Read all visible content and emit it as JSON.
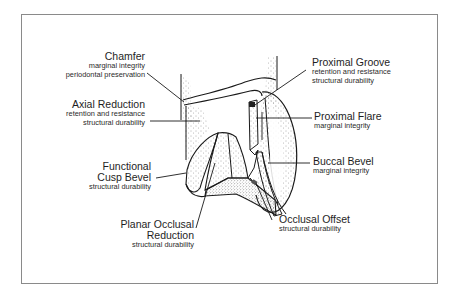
{
  "diagram": {
    "type": "labeled-illustration",
    "labels": [
      {
        "id": "chamfer",
        "title": "Chamfer",
        "subtitles": [
          "marginal integrity",
          "periodontal preservation"
        ]
      },
      {
        "id": "axial-reduction",
        "title": "Axial Reduction",
        "subtitles": [
          "retention and resistance",
          "structural durability"
        ]
      },
      {
        "id": "functional-cusp-bevel",
        "title_lines": [
          "Functional",
          "Cusp Bevel"
        ],
        "subtitles": [
          "structural durability"
        ]
      },
      {
        "id": "planar-occlusal-reduction",
        "title_lines": [
          "Planar Occlusal",
          "Reduction"
        ],
        "subtitles": [
          "structural durability"
        ]
      },
      {
        "id": "proximal-groove",
        "title": "Proximal Groove",
        "subtitles": [
          "retention and resistance",
          "structural durability"
        ]
      },
      {
        "id": "proximal-flare",
        "title": "Proximal Flare",
        "subtitles": [
          "marginal integrity"
        ]
      },
      {
        "id": "buccal-bevel",
        "title": "Buccal Bevel",
        "subtitles": [
          "marginal integrity"
        ]
      },
      {
        "id": "occlusal-offset",
        "title": "Occlusal Offset",
        "subtitles": [
          "structural durability"
        ]
      }
    ]
  }
}
